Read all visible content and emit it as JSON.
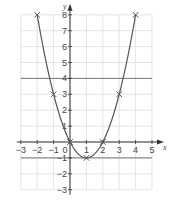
{
  "chart_data": {
    "type": "line",
    "title": "",
    "xlabel": "x",
    "ylabel": "y",
    "xlim": [
      -3,
      5
    ],
    "ylim": [
      -3,
      8
    ],
    "grid": true,
    "x_ticks": [
      "−3",
      "−2",
      "−1",
      "0",
      "1",
      "2",
      "3",
      "4",
      "5"
    ],
    "y_ticks": [
      "−3",
      "−2",
      "−1",
      "1",
      "2",
      "3",
      "4",
      "5",
      "6",
      "7",
      "8"
    ],
    "series": [
      {
        "name": "y = x² − 2x",
        "x": [
          -2,
          -1,
          0,
          1,
          2,
          3,
          4
        ],
        "y": [
          8,
          3,
          0,
          -1,
          0,
          3,
          8
        ],
        "marker": "x",
        "curve": "smooth"
      }
    ],
    "horizontal_lines": [
      4,
      -1
    ]
  },
  "colors": {
    "curve": "#555555",
    "grid": "#dddddd",
    "axis": "#333333",
    "hline": "#777777"
  }
}
